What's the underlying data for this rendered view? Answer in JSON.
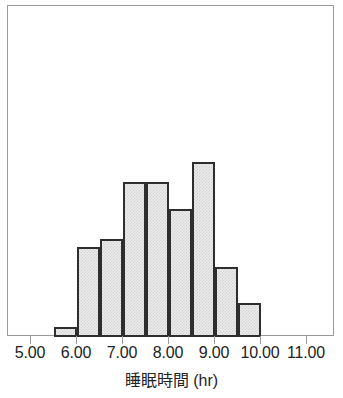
{
  "chart_data": {
    "type": "bar",
    "title": "",
    "subtitle": "",
    "xlabel": "睡眠時間 (hr)",
    "ylabel": "",
    "xlim": [
      4.5,
      11.5
    ],
    "ylim": [
      0,
      20
    ],
    "bin_width": 0.5,
    "grid": false,
    "legend": null,
    "axis_origin_value": 5.0,
    "pixels_per_unit": 46,
    "baseline_y": 336,
    "tick_labels": [
      "5.00",
      "6.00",
      "7.00",
      "8.00",
      "9.00",
      "10.00",
      "11.00"
    ],
    "tick_values": [
      5,
      6,
      7,
      8,
      9,
      10,
      11
    ],
    "bins": [
      {
        "start": 5.5,
        "end": 6.0,
        "count": 1,
        "height_px": 10
      },
      {
        "start": 6.0,
        "end": 6.5,
        "count": 9,
        "height_px": 90
      },
      {
        "start": 6.5,
        "end": 7.0,
        "count": 10,
        "height_px": 98
      },
      {
        "start": 7.0,
        "end": 7.5,
        "count": 16,
        "height_px": 155
      },
      {
        "start": 7.5,
        "end": 8.0,
        "count": 16,
        "height_px": 155
      },
      {
        "start": 8.0,
        "end": 8.5,
        "count": 13,
        "height_px": 128
      },
      {
        "start": 8.5,
        "end": 9.0,
        "count": 18,
        "height_px": 175
      },
      {
        "start": 9.0,
        "end": 9.5,
        "count": 7,
        "height_px": 70
      },
      {
        "start": 9.5,
        "end": 10.0,
        "count": 3,
        "height_px": 34
      }
    ],
    "colors": {
      "bar_fill": "#ebebeb",
      "bar_edge": "#2e2e2e",
      "frame": "#9b9b9b",
      "text": "#232323",
      "background": "#ffffff"
    }
  }
}
